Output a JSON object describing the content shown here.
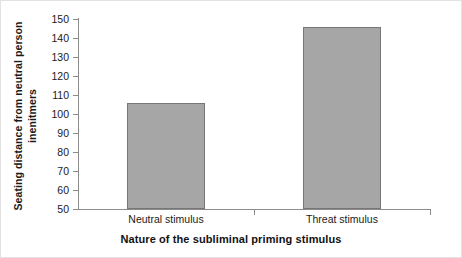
{
  "chart_data": {
    "type": "bar",
    "title": "",
    "categories": [
      "Neutral stimulus",
      "Threat stimulus"
    ],
    "values": [
      106,
      146
    ],
    "xlabel": "Nature of the subliminal priming stimulus",
    "ylabel_line1": "Seating distance from neutral person",
    "ylabel_line2": "inenitmers",
    "ylim": [
      50,
      150
    ],
    "ytick_step": 10,
    "yticks": [
      "150",
      "140",
      "130",
      "120",
      "110",
      "100",
      "90",
      "80",
      "70",
      "60",
      "50"
    ],
    "grid": false,
    "legend": "none",
    "series": [
      {
        "name": "Seating distance",
        "values": [
          106,
          146
        ]
      }
    ],
    "bar_color": "#a6a6a6",
    "bar_border_color": "#767676",
    "axis_color": "#8c8c8c"
  }
}
